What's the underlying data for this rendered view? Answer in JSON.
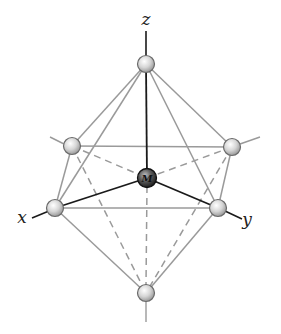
{
  "axes": {
    "z": {
      "label": "z"
    },
    "x": {
      "label": "x"
    },
    "y": {
      "label": "y"
    }
  },
  "center_atom": {
    "label": "M"
  },
  "ligands": [
    {
      "name": "top",
      "position": "+z"
    },
    {
      "name": "bottom",
      "position": "-z"
    },
    {
      "name": "front-left",
      "position": "+x"
    },
    {
      "name": "front-right",
      "position": "+y"
    },
    {
      "name": "back-left",
      "position": "-y"
    },
    {
      "name": "back-right",
      "position": "-x"
    }
  ],
  "colors": {
    "edge": "#9a9a9a",
    "bond": "#1a1a1a",
    "ligand_fill": "#d8d8d8",
    "center_fill": "#3a3a3a"
  }
}
